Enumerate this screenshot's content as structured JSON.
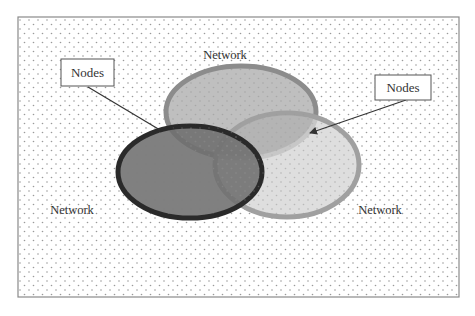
{
  "diagram": {
    "type": "venn",
    "frame": {
      "fill": "#ffffff",
      "dot_color": "#9a9a9a",
      "border_color": "#8a8a8a"
    },
    "sets": [
      {
        "id": "top",
        "label": "Network",
        "fill": "#b4b4b4",
        "stroke": "#8c8c8c"
      },
      {
        "id": "bottom-right",
        "label": "Network",
        "fill": "#d6d6d6",
        "stroke": "#a0a0a0"
      },
      {
        "id": "left",
        "label": "Network",
        "fill": "#6e6e6e",
        "stroke": "#2a2a2a"
      }
    ],
    "callouts": [
      {
        "id": "left-callout",
        "text": "Nodes",
        "points_to": "intersection of left and top networks"
      },
      {
        "id": "right-callout",
        "text": "Nodes",
        "points_to": "intersection of top and bottom-right networks"
      }
    ],
    "labels": {
      "top_network": "Network",
      "left_network": "Network",
      "right_network": "Network",
      "left_nodes": "Nodes",
      "right_nodes": "Nodes"
    }
  }
}
